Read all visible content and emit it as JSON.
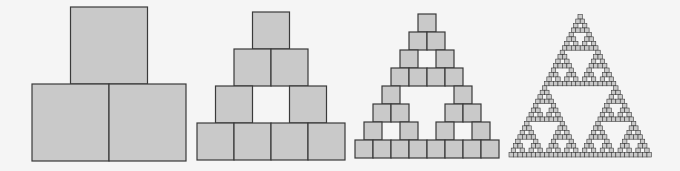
{
  "diagram": {
    "title": "",
    "colors": {
      "fill": "#c9c9c9",
      "stroke": "#3a3a3a",
      "background": "#f5f5f5"
    },
    "figures": [
      {
        "name": "stage-1",
        "level": 1,
        "left": 32,
        "bottom": 161,
        "size": 77
      },
      {
        "name": "stage-2",
        "level": 2,
        "left": 197,
        "bottom": 160,
        "size": 37
      },
      {
        "name": "stage-3",
        "level": 3,
        "left": 355,
        "bottom": 158,
        "size": 18
      },
      {
        "name": "stage-4",
        "level": 5,
        "left": 509,
        "bottom": 157,
        "size": 4.45
      }
    ]
  }
}
